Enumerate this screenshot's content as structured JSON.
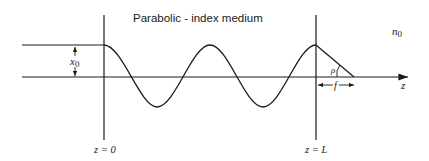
{
  "title": "Parabolic - index medium",
  "labels": {
    "amplitude": "x",
    "amplitude_sub": "0",
    "index": "n",
    "index_sub": "0",
    "axis": "z",
    "angle": "ρ",
    "focal": "f",
    "start": "z = 0",
    "end": "z = L"
  },
  "colors": {
    "line": "#1a1a1a",
    "background": "#ffffff"
  }
}
